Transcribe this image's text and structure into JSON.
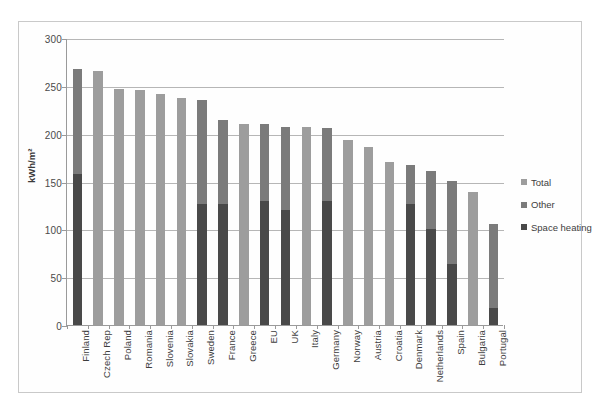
{
  "chart_data": {
    "type": "bar",
    "title": "",
    "subtitle": "",
    "xlabel": "",
    "ylabel": "kWh/m²",
    "ylim": [
      0,
      300
    ],
    "ytick_values": [
      0,
      50,
      100,
      150,
      200,
      250,
      300
    ],
    "ytick_labels": [
      "0",
      "50",
      "100",
      "150",
      "200",
      "250",
      "300"
    ],
    "grid": "horizontal",
    "stacked": true,
    "legend_position": "right",
    "legend": [
      {
        "name": "Total",
        "color": "#9d9d9d"
      },
      {
        "name": "Other",
        "color": "#7b7b7b"
      },
      {
        "name": "Space heating",
        "color": "#494949"
      }
    ],
    "categories": [
      "Finland",
      "Czech Rep",
      "Poland",
      "Romania",
      "Slovenia",
      "Slovakia",
      "Sweden",
      "France",
      "Greece",
      "EU",
      "UK",
      "Italy",
      "Germany",
      "Norway",
      "Austria",
      "Croatia",
      "Denmark",
      "Netherlands",
      "Spain",
      "Bulgaria",
      "Portugal"
    ],
    "series": [
      {
        "name": "Total",
        "values": [
          268,
          266,
          247,
          246,
          241,
          237,
          235,
          214,
          210,
          210,
          207,
          207,
          206,
          193,
          186,
          170,
          167,
          161,
          151,
          139,
          106
        ]
      },
      {
        "name": "Space heating",
        "values": [
          158,
          null,
          null,
          null,
          null,
          null,
          126,
          127,
          null,
          130,
          120,
          null,
          130,
          null,
          null,
          null,
          127,
          100,
          64,
          null,
          18
        ]
      },
      {
        "name": "Other",
        "values": [
          110,
          null,
          null,
          null,
          null,
          null,
          109,
          87,
          null,
          80,
          87,
          null,
          76,
          null,
          null,
          null,
          40,
          61,
          87,
          null,
          88
        ]
      }
    ]
  },
  "axis": {
    "y_title": "kWh/m²"
  },
  "colors": {
    "total": "#9d9d9d",
    "other": "#7b7b7b",
    "space_heating": "#494949",
    "gridline": "#b6b6b6",
    "axis": "#9a9a9a",
    "text": "#3d3d3d",
    "frame": "#c9c9c9",
    "background": "#ffffff"
  }
}
